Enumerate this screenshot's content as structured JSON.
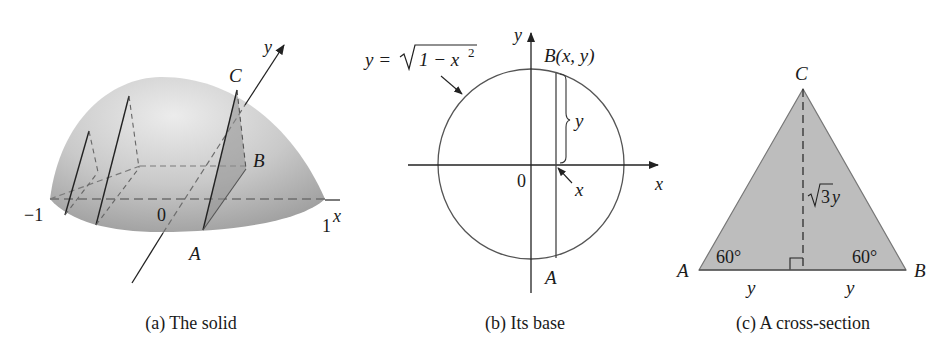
{
  "panels": {
    "solid": {
      "caption": "(a) The solid",
      "labels": {
        "y_axis": "y",
        "x_axis": "x",
        "C": "C",
        "B": "B",
        "A": "A",
        "origin": "0",
        "neg_one": "−1",
        "one": "1"
      }
    },
    "base": {
      "caption": "(b) Its base",
      "labels": {
        "y_axis": "y",
        "x_axis": "x",
        "equation_lhs": "y =",
        "equation_radicand": "1 − x",
        "equation_exp": "2",
        "point_B": "B(x, y)",
        "point_A": "A",
        "origin": "0",
        "x_marker": "x",
        "brace_y": "y"
      }
    },
    "cross_section": {
      "caption": "(c) A cross-section",
      "labels": {
        "C": "C",
        "A": "A",
        "B": "B",
        "angle_left": "60°",
        "angle_right": "60°",
        "height_radicand": "3",
        "height_var": "y",
        "base_left": "y",
        "base_right": "y"
      }
    }
  },
  "colors": {
    "fill_gray": "#bdbdbd",
    "dome_light": "#e6e6e6",
    "dome_dark": "#a9a9a9",
    "line": "#333333",
    "dash": "#6e6e6e"
  }
}
